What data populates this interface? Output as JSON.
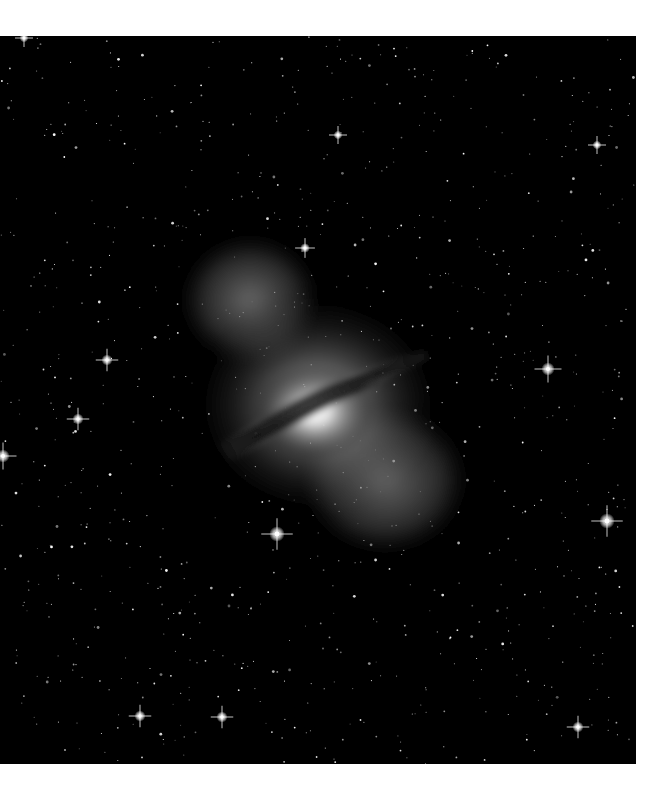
{
  "image": {
    "subject": "galaxy-with-dust-lane-starfield",
    "background_color": "#ffffff",
    "sky_color": "#000000",
    "frame": {
      "x": 0,
      "y": 36,
      "width": 636,
      "height": 728
    },
    "galaxy_center": {
      "x": 318,
      "y": 410
    },
    "bright_stars": [
      {
        "x": 277,
        "y": 534,
        "r": 3.5
      },
      {
        "x": 607,
        "y": 521,
        "r": 3.5
      },
      {
        "x": 548,
        "y": 369,
        "r": 3
      },
      {
        "x": 107,
        "y": 360,
        "r": 2.5
      },
      {
        "x": 3,
        "y": 456,
        "r": 3
      },
      {
        "x": 78,
        "y": 419,
        "r": 2.5
      },
      {
        "x": 140,
        "y": 716,
        "r": 2.5
      },
      {
        "x": 222,
        "y": 717,
        "r": 2.5
      },
      {
        "x": 305,
        "y": 248,
        "r": 2.2
      },
      {
        "x": 578,
        "y": 727,
        "r": 2.5
      },
      {
        "x": 338,
        "y": 135,
        "r": 2
      },
      {
        "x": 597,
        "y": 145,
        "r": 2
      },
      {
        "x": 24,
        "y": 38,
        "r": 2
      }
    ]
  }
}
